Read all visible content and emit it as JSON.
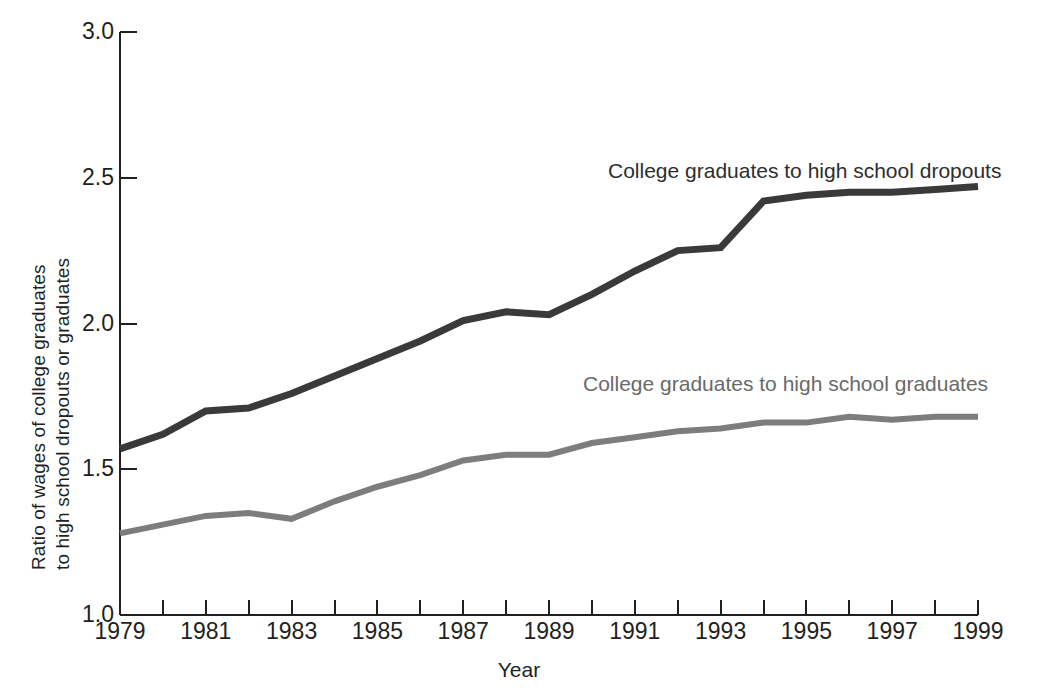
{
  "chart_data": {
    "type": "line",
    "title": "",
    "xlabel": "Year",
    "ylabel_line1": "Ratio of wages of college graduates",
    "ylabel_line2": "to high school dropouts or graduates",
    "ylim": [
      1.0,
      3.0
    ],
    "xlim": [
      1979,
      1999
    ],
    "ytick_labels": [
      "3.0",
      "2.5",
      "2.0",
      "1.5",
      "1.0"
    ],
    "ytick_values": [
      3.0,
      2.5,
      2.0,
      1.5,
      1.0
    ],
    "xtick_labels": [
      "1979",
      "1981",
      "1983",
      "1985",
      "1987",
      "1989",
      "1991",
      "1993",
      "1995",
      "1997",
      "1999"
    ],
    "xtick_values": [
      1979,
      1981,
      1983,
      1985,
      1987,
      1989,
      1991,
      1993,
      1995,
      1997,
      1999
    ],
    "minor_xticks": [
      1980,
      1982,
      1984,
      1986,
      1988,
      1990,
      1992,
      1994,
      1996,
      1998
    ],
    "grid": false,
    "legend_position": "inline-annotation",
    "x": [
      1979,
      1980,
      1981,
      1982,
      1983,
      1984,
      1985,
      1986,
      1987,
      1988,
      1989,
      1990,
      1991,
      1992,
      1993,
      1994,
      1995,
      1996,
      1997,
      1998,
      1999
    ],
    "series": [
      {
        "name": "College graduates to high school dropouts",
        "color": "#3a3a3a",
        "values": [
          1.57,
          1.62,
          1.7,
          1.71,
          1.76,
          1.82,
          1.88,
          1.94,
          2.01,
          2.04,
          2.03,
          2.1,
          2.18,
          2.25,
          2.26,
          2.42,
          2.44,
          2.45,
          2.45,
          2.46,
          2.47
        ]
      },
      {
        "name": "College graduates to high school graduates",
        "color": "#7d7d7d",
        "values": [
          1.28,
          1.31,
          1.34,
          1.35,
          1.33,
          1.39,
          1.44,
          1.48,
          1.53,
          1.55,
          1.55,
          1.59,
          1.61,
          1.63,
          1.64,
          1.66,
          1.66,
          1.68,
          1.67,
          1.68,
          1.68
        ]
      }
    ],
    "annotations": [
      {
        "text": "College graduates to high school dropouts",
        "x_px": 608,
        "y_px": 160,
        "series": 0
      },
      {
        "text": "College graduates to high school graduates",
        "x_px": 583,
        "y_px": 373,
        "series": 1
      }
    ]
  },
  "axis": {
    "color": "#231f20"
  }
}
